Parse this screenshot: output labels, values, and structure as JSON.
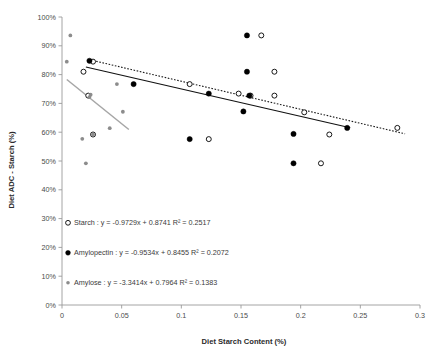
{
  "chart_data": {
    "type": "scatter",
    "title": "",
    "xlabel": "Diet Starch Content (%)",
    "ylabel": "Diet ADC - Starch (%)",
    "xlim": [
      0,
      0.3
    ],
    "ylim": [
      0,
      1.0
    ],
    "grid": false,
    "legend_position": "inside-lower-left",
    "xticks": [
      "0",
      "0.05",
      "0.1",
      "0.15",
      "0.2",
      "0.25",
      "0.3"
    ],
    "xtick_values": [
      0,
      0.05,
      0.1,
      0.15,
      0.2,
      0.25,
      0.3
    ],
    "yticks": [
      "0%",
      "10%",
      "20%",
      "30%",
      "40%",
      "50%",
      "60%",
      "70%",
      "80%",
      "90%",
      "100%"
    ],
    "ytick_values": [
      0,
      0.1,
      0.2,
      0.3,
      0.4,
      0.5,
      0.6,
      0.7,
      0.8,
      0.9,
      1.0
    ],
    "series": [
      {
        "name": "Starch",
        "marker": "open-circle",
        "color": "#000000",
        "fill": "#ffffff",
        "points": [
          {
            "x": 0.026,
            "y": 0.845
          },
          {
            "x": 0.018,
            "y": 0.81
          },
          {
            "x": 0.026,
            "y": 0.592
          },
          {
            "x": 0.022,
            "y": 0.727
          },
          {
            "x": 0.107,
            "y": 0.767
          },
          {
            "x": 0.123,
            "y": 0.576
          },
          {
            "x": 0.148,
            "y": 0.734
          },
          {
            "x": 0.158,
            "y": 0.727
          },
          {
            "x": 0.167,
            "y": 0.936
          },
          {
            "x": 0.178,
            "y": 0.81
          },
          {
            "x": 0.178,
            "y": 0.727
          },
          {
            "x": 0.203,
            "y": 0.669
          },
          {
            "x": 0.217,
            "y": 0.492
          },
          {
            "x": 0.224,
            "y": 0.592
          },
          {
            "x": 0.281,
            "y": 0.615
          }
        ],
        "trendline": {
          "equation": "y = -0.9729x + 0.8741",
          "slope": -0.9729,
          "intercept": 0.8741,
          "r2": "0.2517",
          "style": "dotted",
          "color": "#1a1a1a",
          "x_start": 0.026,
          "x_end": 0.2875
        }
      },
      {
        "name": "Amylopectin",
        "marker": "filled-circle",
        "color": "#000000",
        "fill": "#000000",
        "points": [
          {
            "x": 0.023,
            "y": 0.848
          },
          {
            "x": 0.06,
            "y": 0.767
          },
          {
            "x": 0.107,
            "y": 0.576
          },
          {
            "x": 0.123,
            "y": 0.734
          },
          {
            "x": 0.155,
            "y": 0.936
          },
          {
            "x": 0.155,
            "y": 0.81
          },
          {
            "x": 0.157,
            "y": 0.727
          },
          {
            "x": 0.152,
            "y": 0.672
          },
          {
            "x": 0.194,
            "y": 0.594
          },
          {
            "x": 0.194,
            "y": 0.492
          },
          {
            "x": 0.239,
            "y": 0.615
          }
        ],
        "trendline": {
          "equation": "y = -0.9534x + 0.8455",
          "slope": -0.9534,
          "intercept": 0.8455,
          "r2": "0.2072",
          "style": "solid",
          "color": "#111111",
          "x_start": 0.02,
          "x_end": 0.2415
        }
      },
      {
        "name": "Amylose",
        "marker": "small-dot",
        "color": "#8c8c8c",
        "fill": "#8c8c8c",
        "points": [
          {
            "x": 0.007,
            "y": 0.936
          },
          {
            "x": 0.004,
            "y": 0.845
          },
          {
            "x": 0.017,
            "y": 0.577
          },
          {
            "x": 0.02,
            "y": 0.492
          },
          {
            "x": 0.023,
            "y": 0.722
          },
          {
            "x": 0.024,
            "y": 0.73
          },
          {
            "x": 0.026,
            "y": 0.592
          },
          {
            "x": 0.04,
            "y": 0.614
          },
          {
            "x": 0.046,
            "y": 0.767
          },
          {
            "x": 0.051,
            "y": 0.671
          }
        ],
        "trendline": {
          "equation": "y = -3.3414x + 0.7964",
          "slope": -3.3414,
          "intercept": 0.7964,
          "r2": "0.1383",
          "style": "solid",
          "color": "#a6a6a6",
          "x_start": 0.004,
          "x_end": 0.056
        }
      }
    ],
    "legend_entries": [
      {
        "marker": "open-circle",
        "name": "Starch",
        "separator": " : ",
        "equation": "y = -0.9729x + 0.8741",
        "r2_label": "R² = 0.2517",
        "full_text": "Starch :  y = -0.9729x + 0.8741   R² = 0.2517"
      },
      {
        "marker": "filled-circle",
        "name": "Amylopectin",
        "separator": " : ",
        "equation": "y = -0.9534x + 0.8455",
        "r2_label": "R² = 0.2072",
        "full_text": "Amylopectin :  y = -0.9534x + 0.8455 R² = 0.2072"
      },
      {
        "marker": "small-dot",
        "name": "Amylose",
        "separator": " : ",
        "equation": "y = -3.3414x + 0.7964",
        "r2_label": "R² = 0.1383",
        "full_text": "Amylose :  y = -3.3414x + 0.7964    R² = 0.1383"
      }
    ]
  }
}
